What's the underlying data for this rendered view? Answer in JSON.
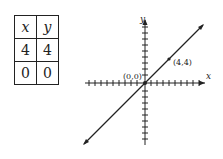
{
  "table": {
    "headers": [
      "x",
      "y"
    ],
    "rows": [
      [
        "4",
        "4"
      ],
      [
        "0",
        "0"
      ]
    ]
  },
  "graph": {
    "x_axis_label": "x",
    "y_axis_label": "y",
    "points": [
      {
        "label": "(0,0)",
        "x": 0,
        "y": 0
      },
      {
        "label": "(4,4)",
        "x": 4,
        "y": 4
      }
    ],
    "line": "y = x"
  }
}
